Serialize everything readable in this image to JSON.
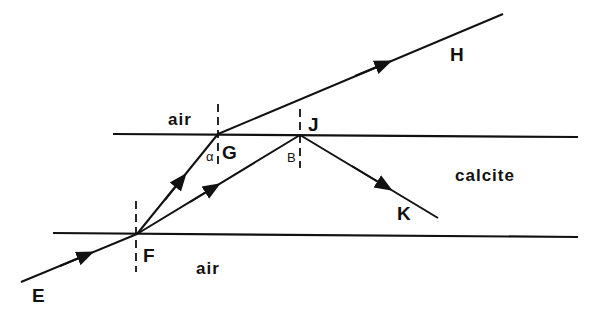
{
  "diagram": {
    "colors": {
      "ink": "#111111",
      "background": "#ffffff"
    },
    "media": {
      "upper_region": "air",
      "middle_region": "calcite",
      "lower_region": "air"
    },
    "points": {
      "E": "E",
      "F": "F",
      "G": "G",
      "J": "J",
      "H": "H",
      "K": "K"
    },
    "angles": {
      "alpha": "α",
      "beta": "B"
    },
    "rays": [
      {
        "from": "E",
        "to": "F",
        "label": "incident ray"
      },
      {
        "from": "F",
        "to": "G",
        "label": "refracted ray (ordinary)"
      },
      {
        "from": "F",
        "to": "J",
        "label": "refracted ray (extraordinary)"
      },
      {
        "from": "G",
        "to": "H",
        "label": "emergent ray"
      },
      {
        "from": "J",
        "to": "K",
        "label": "internally reflected ray"
      }
    ],
    "boundaries": [
      {
        "name": "upper surface",
        "between": [
          "air",
          "calcite"
        ]
      },
      {
        "name": "lower surface",
        "between": [
          "calcite",
          "air"
        ]
      }
    ],
    "normals": [
      "F",
      "G",
      "J"
    ]
  }
}
